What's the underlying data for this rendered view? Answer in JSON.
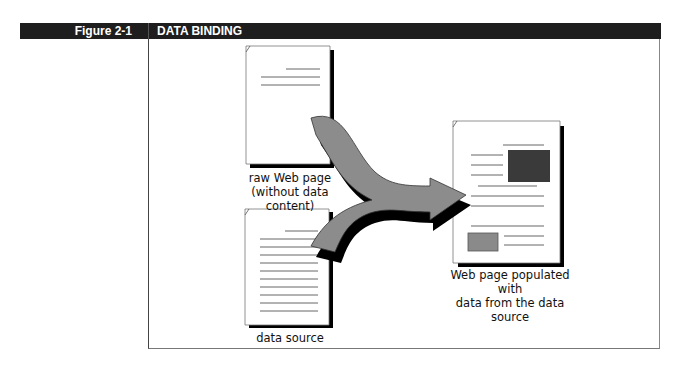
{
  "figure": {
    "label": "Figure 2-1",
    "title": "DATA BINDING"
  },
  "diagram": {
    "nodes": [
      {
        "id": "raw-page",
        "caption_line1": "raw Web page",
        "caption_line2": "(without data content)"
      },
      {
        "id": "data-source",
        "caption_line1": "data source"
      },
      {
        "id": "populated-page",
        "caption_line1": "Web page populated with",
        "caption_line2": "data from the data source"
      }
    ],
    "edges": [
      {
        "from": "raw-page",
        "to": "populated-page"
      },
      {
        "from": "data-source",
        "to": "populated-page"
      }
    ],
    "colors": {
      "header": "#1e1e1e",
      "arrow": "#8c8c8c",
      "content_block": "#3a3a3a",
      "small_block": "#8a8a8a"
    }
  }
}
